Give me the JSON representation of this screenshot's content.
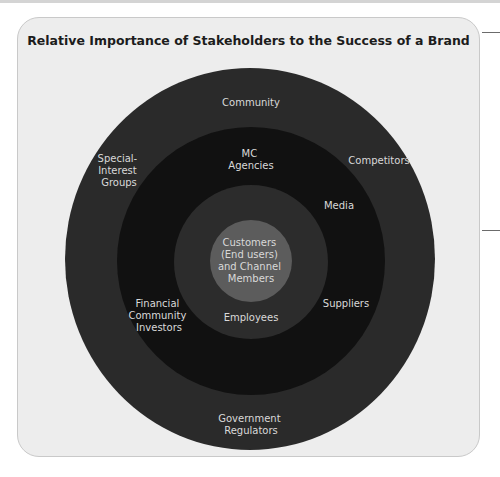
{
  "title": "Relative Importance of Stakeholders to the Success of a Brand",
  "colors": {
    "panel_background": "#ededed",
    "outer_ring": "#2a2a2a",
    "second_ring": "#111111",
    "third_ring": "#2c2c2c",
    "center_circle": "#5c5c5c",
    "label_text": "#d9d9d9"
  },
  "rings": [
    {
      "name": "outer",
      "labels": [
        {
          "id": "community",
          "lines": [
            "Community"
          ]
        },
        {
          "id": "special-interest-groups",
          "lines": [
            "Special-",
            "Interest",
            "Groups"
          ]
        },
        {
          "id": "competitors",
          "lines": [
            "Competitors"
          ]
        },
        {
          "id": "government-regulators",
          "lines": [
            "Government",
            "Regulators"
          ]
        }
      ]
    },
    {
      "name": "second",
      "labels": [
        {
          "id": "mc-agencies",
          "lines": [
            "MC",
            "Agencies"
          ]
        },
        {
          "id": "media",
          "lines": [
            "Media"
          ]
        },
        {
          "id": "financial-community-investors",
          "lines": [
            "Financial",
            "Community",
            "Investors"
          ]
        },
        {
          "id": "suppliers",
          "lines": [
            "Suppliers"
          ]
        }
      ]
    },
    {
      "name": "third",
      "labels": [
        {
          "id": "employees",
          "lines": [
            "Employees"
          ]
        }
      ]
    },
    {
      "name": "center",
      "labels": [
        {
          "id": "customers",
          "lines": [
            "Customers",
            "(End users)",
            "and Channel",
            "Members"
          ]
        }
      ]
    }
  ]
}
